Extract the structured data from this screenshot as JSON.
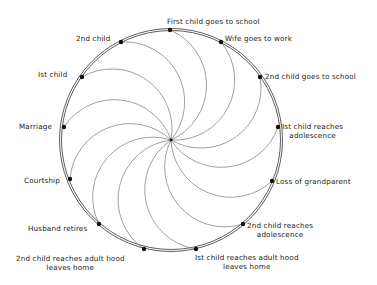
{
  "diagram": {
    "title": "",
    "center": [
      171,
      140
    ],
    "radius": 110,
    "arc_radius": 60,
    "colors": {
      "ring": "#333333",
      "arc": "#777777",
      "dot": "#111111",
      "text": "#1a1a1a"
    },
    "events": [
      {
        "id": "first-child-goes-to-school",
        "line1": "First child goes to school",
        "line2": "",
        "dot": [
          170,
          30
        ]
      },
      {
        "id": "wife-goes-to-work",
        "line1": "Wife goes to work",
        "line2": "",
        "dot": [
          221,
          42
        ]
      },
      {
        "id": "2nd-child-goes-to-school",
        "line1": "2nd child goes to school",
        "line2": "",
        "dot": [
          260,
          77
        ]
      },
      {
        "id": "1st-child-reaches-adolescence",
        "line1": "Ist child reaches",
        "line2": "adolescence",
        "dot": [
          278,
          127
        ]
      },
      {
        "id": "loss-of-grandparent",
        "line1": "Loss of grandparent",
        "line2": "",
        "dot": [
          272,
          181
        ]
      },
      {
        "id": "2nd-child-reaches-adolescence",
        "line1": "2nd child reaches",
        "line2": "adolescence",
        "dot": [
          243,
          224
        ]
      },
      {
        "id": "1st-child-reaches-adulthood",
        "line1": "Ist child reaches adult hood",
        "line2": "leaves home",
        "dot": [
          196,
          249
        ]
      },
      {
        "id": "2nd-child-reaches-adulthood",
        "line1": "2nd child reaches  adult hood",
        "line2": "leaves home",
        "dot": [
          144,
          249
        ]
      },
      {
        "id": "husband-retires",
        "line1": "Husband retires",
        "line2": "",
        "dot": [
          99,
          224
        ]
      },
      {
        "id": "courtship",
        "line1": "Courtship",
        "line2": "",
        "dot": [
          70,
          179
        ]
      },
      {
        "id": "marriage",
        "line1": "Marriage",
        "line2": "",
        "dot": [
          64,
          127
        ]
      },
      {
        "id": "1st-child",
        "line1": "Ist  child",
        "line2": "",
        "dot": [
          82,
          77
        ]
      },
      {
        "id": "2nd-child",
        "line1": "2nd child",
        "line2": "",
        "dot": [
          121,
          42
        ]
      }
    ]
  }
}
